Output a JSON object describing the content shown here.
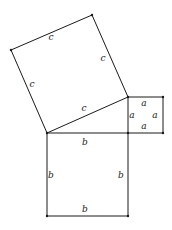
{
  "diagram": {
    "colors": {
      "line": "#1a1a1a",
      "background": "#ffffff"
    },
    "triangle": {
      "vertices": [
        [
          47,
          133
        ],
        [
          128,
          133
        ],
        [
          128,
          97
        ]
      ]
    },
    "squares": [
      {
        "name": "square-c",
        "side_label": "c",
        "vertices": [
          [
            47,
            133
          ],
          [
            128,
            97
          ],
          [
            92,
            15
          ],
          [
            11,
            50
          ]
        ],
        "labels": [
          {
            "text": "c",
            "x": 51,
            "y": 40
          },
          {
            "text": "c",
            "x": 103,
            "y": 61
          },
          {
            "text": "c",
            "x": 32,
            "y": 87
          },
          {
            "text": "c",
            "x": 84,
            "y": 111
          }
        ]
      },
      {
        "name": "square-a",
        "side_label": "a",
        "vertices": [
          [
            128,
            97
          ],
          [
            163,
            97
          ],
          [
            163,
            133
          ],
          [
            128,
            133
          ]
        ],
        "labels": [
          {
            "text": "a",
            "x": 144,
            "y": 106
          },
          {
            "text": "a",
            "x": 132,
            "y": 118
          },
          {
            "text": "a",
            "x": 155,
            "y": 118
          },
          {
            "text": "a",
            "x": 144,
            "y": 129
          }
        ]
      },
      {
        "name": "square-b",
        "side_label": "b",
        "vertices": [
          [
            47,
            133
          ],
          [
            128,
            133
          ],
          [
            128,
            216
          ],
          [
            47,
            216
          ]
        ],
        "labels": [
          {
            "text": "b",
            "x": 85,
            "y": 145
          },
          {
            "text": "b",
            "x": 51,
            "y": 178
          },
          {
            "text": "b",
            "x": 121,
            "y": 178
          },
          {
            "text": "b",
            "x": 85,
            "y": 212
          }
        ]
      }
    ]
  }
}
